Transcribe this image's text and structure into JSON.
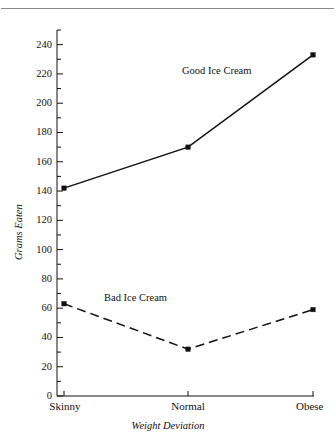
{
  "figure": {
    "background_color": "#ffffff",
    "ink_color": "#111111",
    "rule_color": "#8a8a8a",
    "has_top_rule": true
  },
  "chart_data": {
    "type": "line",
    "title": "",
    "xlabel": "Weight Deviation",
    "ylabel": "Grams Eaten",
    "categories": [
      "Skinny",
      "Normal",
      "Obese"
    ],
    "ylim": [
      0,
      250
    ],
    "y_major_ticks": [
      0,
      20,
      40,
      60,
      80,
      100,
      120,
      140,
      160,
      180,
      200,
      220,
      240
    ],
    "y_minor_ticks": [
      10,
      30,
      50,
      70,
      90,
      110,
      130,
      150,
      170,
      190,
      210,
      230,
      250
    ],
    "y_tick_labels": [
      "0",
      "20",
      "40",
      "60",
      "80",
      "100",
      "120",
      "140",
      "160",
      "180",
      "200",
      "220",
      "240"
    ],
    "grid": false,
    "legend_position": "inline-annotation",
    "series": [
      {
        "name": "Good Ice Cream",
        "values": [
          142,
          170,
          233
        ],
        "line_style": "solid",
        "marker": "square",
        "color": "#111111",
        "annotation": "Good Ice Cream"
      },
      {
        "name": "Bad Ice Cream",
        "values": [
          63,
          32,
          59
        ],
        "line_style": "dashed",
        "marker": "square",
        "color": "#111111",
        "annotation": "Bad Ice Cream"
      }
    ],
    "annotations": [
      {
        "text": "Good Ice Cream",
        "series": "Good Ice Cream"
      },
      {
        "text": "Bad Ice Cream",
        "series": "Bad Ice Cream"
      }
    ]
  }
}
